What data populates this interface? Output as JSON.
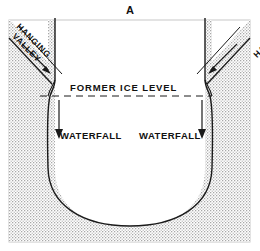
{
  "figure": {
    "panel_letter": "A",
    "caption_labels": {
      "hanging_valley_left_line1": "HANGING",
      "hanging_valley_left_line2": "VALLEY",
      "hanging_valley_right_line1": "HANGING",
      "hanging_valley_right_line2": "VALLEY",
      "former_ice_level": "FORMER ICE LEVEL",
      "waterfall_left": "WATERFALL",
      "waterfall_right": "WATERFALL"
    },
    "colors": {
      "ink": "#1a1a1a",
      "stipple": "#b9b9b9",
      "background": "#ffffff",
      "frame": "#9a9a9a"
    }
  },
  "diagram_data": {
    "type": "cross-section",
    "subject": "Glacial U-shaped valley with hanging valleys",
    "elements": [
      {
        "name": "panel-letter",
        "text": "A"
      },
      {
        "name": "bedrock-stipple",
        "description": "stippled rock mass filling the block"
      },
      {
        "name": "u-valley-profile",
        "description": "U-shaped trough eroded by former glacier"
      },
      {
        "name": "hanging-valley-left",
        "description": "tributary valley truncated above main trough, left side"
      },
      {
        "name": "hanging-valley-right",
        "description": "tributary valley truncated above main trough, right side"
      },
      {
        "name": "former-ice-level-line",
        "style": "dashed",
        "text": "FORMER ICE LEVEL"
      },
      {
        "name": "waterfall-left-arrow",
        "direction": "down",
        "text": "WATERFALL"
      },
      {
        "name": "waterfall-right-arrow",
        "direction": "down",
        "text": "WATERFALL"
      }
    ]
  }
}
